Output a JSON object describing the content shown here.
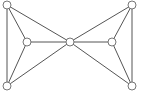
{
  "graph": {
    "type": "undirected",
    "colors": {
      "edge": "#555555",
      "node_stroke": "#666666",
      "node_fill": "#ffffff",
      "background": "#ffffff"
    },
    "node_radius": 4,
    "nodes": [
      {
        "id": "top-left",
        "x": 7,
        "y": 5
      },
      {
        "id": "bottom-left",
        "x": 7,
        "y": 86
      },
      {
        "id": "left-mid",
        "x": 27,
        "y": 42
      },
      {
        "id": "center",
        "x": 70,
        "y": 42
      },
      {
        "id": "right-mid",
        "x": 112,
        "y": 42
      },
      {
        "id": "top-right",
        "x": 132,
        "y": 5
      },
      {
        "id": "bottom-right",
        "x": 132,
        "y": 86
      }
    ],
    "edges": [
      [
        "top-left",
        "bottom-left"
      ],
      [
        "top-left",
        "left-mid"
      ],
      [
        "bottom-left",
        "left-mid"
      ],
      [
        "top-left",
        "center"
      ],
      [
        "bottom-left",
        "center"
      ],
      [
        "left-mid",
        "center"
      ],
      [
        "center",
        "right-mid"
      ],
      [
        "center",
        "top-right"
      ],
      [
        "center",
        "bottom-right"
      ],
      [
        "right-mid",
        "top-right"
      ],
      [
        "right-mid",
        "bottom-right"
      ],
      [
        "top-right",
        "bottom-right"
      ]
    ]
  }
}
